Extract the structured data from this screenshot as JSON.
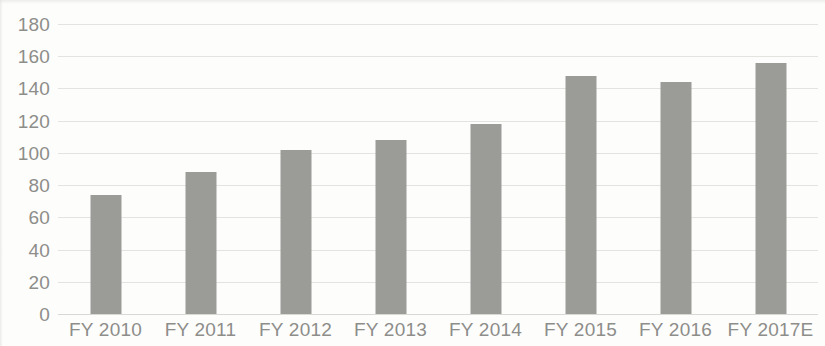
{
  "chart_data": {
    "type": "bar",
    "title": "",
    "subtitle": "",
    "xlabel": "",
    "ylabel": "",
    "categories": [
      "FY 2010",
      "FY 2011",
      "FY 2012",
      "FY 2013",
      "FY 2014",
      "FY 2015",
      "FY 2016",
      "FY 2017E"
    ],
    "values": [
      74,
      88,
      102,
      108,
      118,
      148,
      144,
      156
    ],
    "series": [
      {
        "name": "",
        "values": [
          74,
          88,
          102,
          108,
          118,
          148,
          144,
          156
        ]
      }
    ],
    "ylim": [
      0,
      180
    ],
    "ytick_step": 20,
    "ytick_labels": [
      "0",
      "20",
      "40",
      "60",
      "80",
      "100",
      "120",
      "140",
      "160",
      "180"
    ],
    "ytick_values": [
      0,
      20,
      40,
      60,
      80,
      100,
      120,
      140,
      160,
      180
    ],
    "grid": true,
    "grid_axis": "y",
    "legend": false,
    "legend_position": "none",
    "colors": {
      "bar": "#9b9b98",
      "gridline": "#e3e3e0",
      "axis_text": "#8d8d8a",
      "background": "#fdfdfc"
    }
  }
}
